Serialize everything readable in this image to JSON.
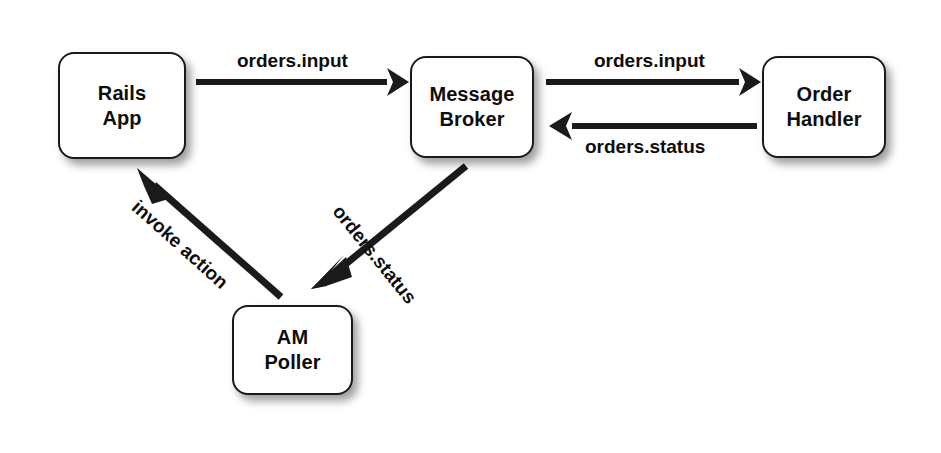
{
  "diagram": {
    "background_color": "#ffffff",
    "stroke_color": "#1a1a1a",
    "text_color": "#0d0d0d",
    "nodes": [
      {
        "id": "rails-app",
        "line1": "Rails",
        "line2": "App"
      },
      {
        "id": "message-broker",
        "line1": "Message",
        "line2": "Broker"
      },
      {
        "id": "order-handler",
        "line1": "Order",
        "line2": "Handler"
      },
      {
        "id": "am-poller",
        "line1": "AM",
        "line2": "Poller"
      }
    ],
    "edges": [
      {
        "id": "rails-to-broker",
        "label": "orders.input",
        "from": "rails-app",
        "to": "message-broker",
        "direction": "right"
      },
      {
        "id": "broker-to-handler",
        "label": "orders.input",
        "from": "message-broker",
        "to": "order-handler",
        "direction": "right"
      },
      {
        "id": "handler-to-broker",
        "label": "orders.status",
        "from": "order-handler",
        "to": "message-broker",
        "direction": "left"
      },
      {
        "id": "broker-to-poller",
        "label": "orders.status",
        "from": "message-broker",
        "to": "am-poller",
        "direction": "down-left"
      },
      {
        "id": "poller-to-rails",
        "label": "invoke action",
        "from": "am-poller",
        "to": "rails-app",
        "direction": "up-left"
      }
    ]
  }
}
